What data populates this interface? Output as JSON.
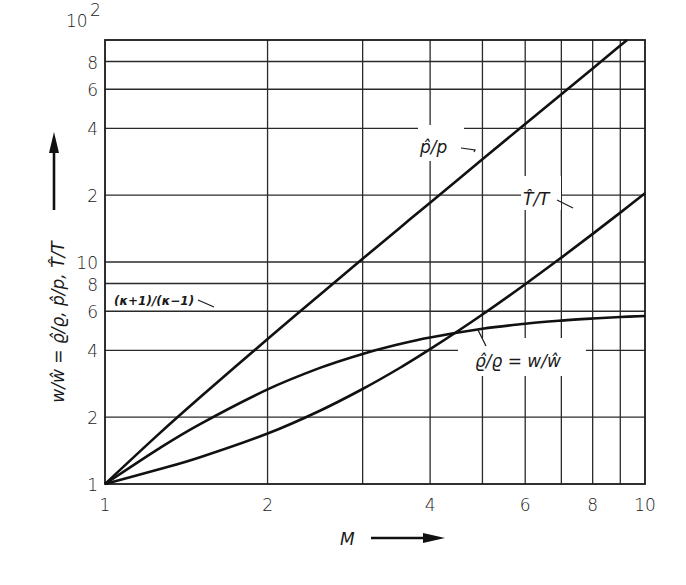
{
  "chart_data": {
    "type": "line",
    "title": "",
    "xlabel": "M",
    "ylabel": "w/ŵ = ϱ̂/ϱ, p̂/p, T̂/T",
    "xscale": "log",
    "yscale": "log",
    "xlim": [
      1,
      10
    ],
    "ylim": [
      1,
      100
    ],
    "grid": true,
    "x_ticks": [
      {
        "value": 1,
        "label": "1"
      },
      {
        "value": 2,
        "label": "2"
      },
      {
        "value": 4,
        "label": "4"
      },
      {
        "value": 6,
        "label": "6"
      },
      {
        "value": 8,
        "label": "8"
      },
      {
        "value": 10,
        "label": "10"
      }
    ],
    "x_gridlines": [
      2,
      3,
      4,
      5,
      6,
      7,
      8,
      9
    ],
    "y_ticks": [
      {
        "value": 1,
        "label": "1"
      },
      {
        "value": 2,
        "label": "2"
      },
      {
        "value": 4,
        "label": "4"
      },
      {
        "value": 6,
        "label": "6"
      },
      {
        "value": 8,
        "label": "8"
      },
      {
        "value": 10,
        "label": "10"
      },
      {
        "value": 20,
        "label": "2"
      },
      {
        "value": 40,
        "label": "4"
      },
      {
        "value": 60,
        "label": "6"
      },
      {
        "value": 80,
        "label": "8"
      },
      {
        "value": 100,
        "label": "10",
        "superscript": "2"
      }
    ],
    "y_gridlines": [
      2,
      4,
      6,
      8,
      10,
      20,
      40,
      60,
      80
    ],
    "series": [
      {
        "name": "p̂/p",
        "x": [
          1,
          1.25,
          1.5,
          2,
          2.5,
          3,
          3.5,
          4,
          5,
          6,
          7,
          8,
          9,
          9.26
        ],
        "values": [
          1,
          1.656,
          2.458,
          4.5,
          7.125,
          10.333,
          14.125,
          18.5,
          29,
          41.833,
          57,
          74.5,
          94.333,
          99.87
        ]
      },
      {
        "name": "T̂/T",
        "x": [
          1,
          1.25,
          1.5,
          2,
          2.5,
          3,
          3.5,
          4,
          5,
          6,
          7,
          8,
          9,
          10
        ],
        "values": [
          1,
          1.159,
          1.32,
          1.688,
          2.138,
          2.679,
          3.315,
          4.047,
          5.8,
          7.941,
          10.469,
          13.387,
          16.693,
          20.388
        ]
      },
      {
        "name": "ϱ̂/ϱ = w/ŵ",
        "x": [
          1,
          1.25,
          1.5,
          2,
          2.5,
          3,
          3.5,
          4,
          5,
          6,
          7,
          8,
          9,
          10
        ],
        "values": [
          1,
          1.429,
          1.862,
          2.667,
          3.333,
          3.857,
          4.261,
          4.571,
          5,
          5.268,
          5.444,
          5.565,
          5.651,
          5.714
        ]
      }
    ],
    "annotations": [
      {
        "text": "p̂/p",
        "target_series": "p̂/p"
      },
      {
        "text": "T̂/T",
        "target_series": "T̂/T"
      },
      {
        "text": "ϱ̂/ϱ = w/ŵ",
        "target_series": "ϱ̂/ϱ = w/ŵ"
      },
      {
        "text": "(κ+1)/(κ−1)",
        "value": 6,
        "note": "asymptote of ϱ̂/ϱ"
      }
    ]
  },
  "labels": {
    "x_axis": "M",
    "y_axis": "w/ŵ = ϱ̂/ϱ, p̂/p, T̂/T",
    "curve_p": "p̂/p",
    "curve_t": "T̂/T",
    "curve_rho": "ϱ̂/ϱ = w/ŵ",
    "asymptote": "(κ+1)/(κ−1)",
    "y_top_base": "10",
    "y_top_exp": "2"
  }
}
